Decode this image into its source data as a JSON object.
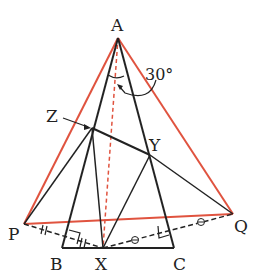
{
  "diagram": {
    "type": "geometry",
    "points": {
      "A": {
        "label": "A",
        "x": 118,
        "y": 38
      },
      "B": {
        "label": "B",
        "x": 62,
        "y": 248
      },
      "C": {
        "label": "C",
        "x": 174,
        "y": 248
      },
      "X": {
        "label": "X",
        "x": 103,
        "y": 248
      },
      "P": {
        "label": "P",
        "x": 24,
        "y": 224
      },
      "Q": {
        "label": "Q",
        "x": 233,
        "y": 214
      },
      "Z": {
        "label": "Z",
        "x": 92,
        "y": 128
      },
      "Y": {
        "label": "Y",
        "x": 150,
        "y": 155
      }
    },
    "angle_label": "30°",
    "colors": {
      "black": "#222222",
      "red": "#e0533f",
      "red_dashed": "#e0533f"
    },
    "segments": {
      "black": [
        "AB",
        "AC",
        "BC",
        "ZY",
        "PZ",
        "ZX",
        "XY",
        "YQ"
      ],
      "red": [
        "AP",
        "AQ",
        "PQ"
      ],
      "red_dashed": [
        "AX"
      ],
      "black_dashed": [
        "PX",
        "XQ"
      ]
    },
    "marks": {
      "equal_double_tick": [
        "PB-foot",
        "foot-X"
      ],
      "equal_circle": [
        "X-foot",
        "foot-Q"
      ],
      "right_angles": [
        "on AB foot of PX",
        "on AC foot of XQ"
      ]
    }
  }
}
